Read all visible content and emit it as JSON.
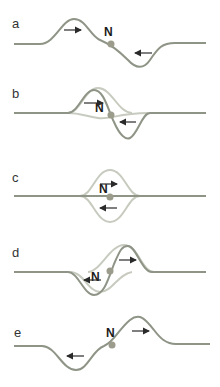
{
  "figure": {
    "topic": "Superposition of two pulses traveling in opposite directions passing through node N",
    "colors": {
      "wave_dark": "#8e9486",
      "wave_light": "#c7cbbf",
      "node_dot": "#9c9c8c",
      "arrow": "#2a2a2a"
    },
    "panels": [
      {
        "label": "a",
        "node_label": "N",
        "description": "Upward pulse moving right, downward pulse moving left, separated"
      },
      {
        "label": "b",
        "node_label": "N",
        "description": "Pulses begin to overlap; resultant shown dark, individual pulses light"
      },
      {
        "label": "c",
        "node_label": "N",
        "description": "Pulses fully overlap; resultant is flat line"
      },
      {
        "label": "d",
        "node_label": "N",
        "description": "Pulses separating after overlap"
      },
      {
        "label": "e",
        "node_label": "N",
        "description": "Downward pulse moving left, upward pulse moving right, separated"
      }
    ]
  }
}
